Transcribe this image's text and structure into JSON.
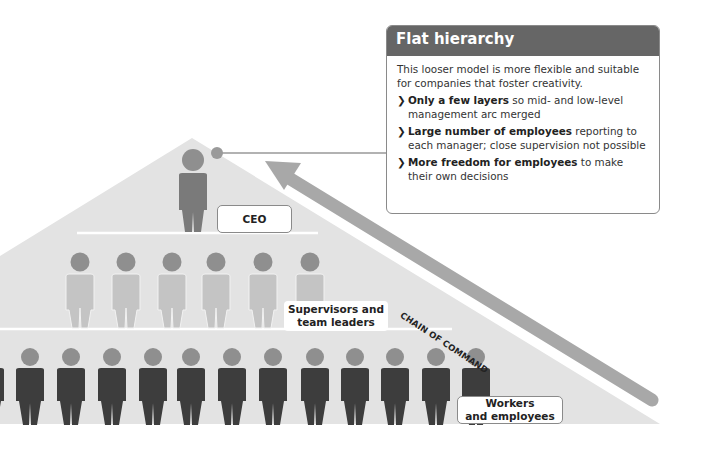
{
  "info_box": {
    "title": "Flat hierarchy",
    "intro": "This looser model is more flexible and suitable for companies that foster creativity.",
    "bullets": [
      {
        "bold": "Only a few layers",
        "rest": " so mid- and low-level management arc merged"
      },
      {
        "bold": "Large number of employees",
        "rest": " reporting to each manager; close supervision not possible"
      },
      {
        "bold": "More freedom for employees",
        "rest": " to make their own decisions"
      }
    ],
    "bullet_glyph": "❯"
  },
  "pyramid": {
    "levels": [
      {
        "name": "ceo",
        "label": "CEO",
        "count": 1
      },
      {
        "name": "supervisors",
        "label_line1": "Supervisors and",
        "label_line2": "team leaders",
        "count": 6
      },
      {
        "name": "workers",
        "label_line1": "Workers",
        "label_line2": "and employees",
        "count": 12
      }
    ]
  },
  "arrow": {
    "label": "CHAIN OF COMMAND"
  },
  "colors": {
    "pyramid_fill": "#e3e3e3",
    "arrow": "#a8a8a8",
    "header": "#666666",
    "head": "#8f8f8f",
    "ceo_body": "#7a7a7a",
    "supervisor_body": "#c4c4c4",
    "worker_body": "#3d3d3d"
  }
}
